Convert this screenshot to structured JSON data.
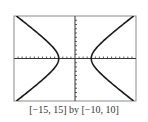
{
  "chart_data": {
    "type": "line",
    "title": "",
    "caption": "[−15, 15] by [−10, 10]",
    "xlabel": "",
    "ylabel": "",
    "xlim": [
      -15,
      15
    ],
    "ylim": [
      -10,
      10
    ],
    "xscale_tick": 1,
    "yscale_tick": 1,
    "grid": false,
    "legend": null,
    "series": [
      {
        "name": "hyperbola right branch",
        "equation": "x^2/16 - y^2/7.7 = 1",
        "x": [
          14.4,
          10.0,
          7.0,
          5.0,
          4.0,
          5.0,
          7.0,
          10.0,
          14.4
        ],
        "y": [
          10,
          6.4,
          4.0,
          2.1,
          0,
          -2.1,
          -4.0,
          -6.4,
          -10
        ]
      },
      {
        "name": "hyperbola left branch",
        "x": [
          -14.4,
          -10.0,
          -7.0,
          -5.0,
          -4.0,
          -5.0,
          -7.0,
          -10.0,
          -14.4
        ],
        "y": [
          10,
          6.4,
          4.0,
          2.1,
          0,
          -2.1,
          -4.0,
          -6.4,
          -10
        ]
      }
    ],
    "vertices": [
      [
        -4,
        0
      ],
      [
        4,
        0
      ]
    ],
    "colors": {
      "curve": "#1a1a1a",
      "frame": "#888888",
      "axes": "#333333"
    }
  }
}
